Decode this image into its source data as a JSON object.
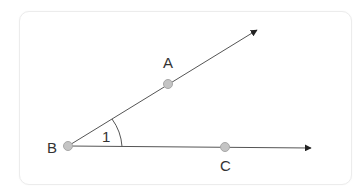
{
  "diagram": {
    "type": "geometry-angle",
    "vertex": {
      "label": "B",
      "x": 68,
      "y": 146
    },
    "points": [
      {
        "label": "A",
        "x": 168,
        "y": 84,
        "label_x": 163,
        "label_y": 68
      },
      {
        "label": "B",
        "x": 68,
        "y": 146,
        "label_x": 47,
        "label_y": 153
      },
      {
        "label": "C",
        "x": 225,
        "y": 147,
        "label_x": 220,
        "label_y": 171
      }
    ],
    "rays": [
      {
        "name": "ray-BA",
        "from": "B",
        "through": "A",
        "tip_x": 257,
        "tip_y": 30
      },
      {
        "name": "ray-BC",
        "from": "B",
        "through": "C",
        "tip_x": 311,
        "tip_y": 148
      }
    ],
    "angle_label": {
      "text": "1",
      "x": 103,
      "y": 142
    },
    "colors": {
      "line": "#555555",
      "point_fill": "#c4c4c4",
      "point_stroke": "#a8a8a8",
      "text": "#333333",
      "card_border": "#ececec"
    }
  }
}
